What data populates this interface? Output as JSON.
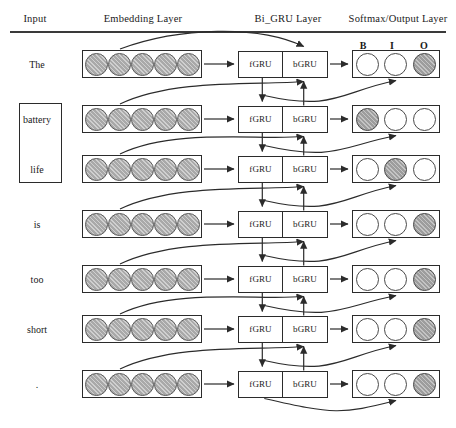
{
  "diagram": {
    "headers": [
      {
        "id": "input",
        "label": "Input",
        "x": 35,
        "y": 18
      },
      {
        "id": "embedding",
        "label": "Embedding Layer",
        "x": 143,
        "y": 18
      },
      {
        "id": "bigru",
        "label": "Bi_GRU Layer",
        "x": 288,
        "y": 18
      },
      {
        "id": "softmax",
        "label": "Softmax/Output Layer",
        "x": 398,
        "y": 18
      }
    ],
    "tag_labels": [
      {
        "tag": "B",
        "x": 363,
        "y": 40
      },
      {
        "tag": "I",
        "x": 392,
        "y": 40
      },
      {
        "tag": "O",
        "x": 424,
        "y": 40
      }
    ],
    "gru": {
      "forward_label": "fGRU",
      "backward_label": "bGRU"
    },
    "embedding_units_per_token": 5,
    "aspect_box": {
      "x": 19,
      "y": 103,
      "width": 41,
      "height": 78
    },
    "rows": [
      {
        "index": 0,
        "token": "The",
        "y": 64,
        "tags": [
          "B",
          "I",
          "O"
        ],
        "active": [
          false,
          false,
          true
        ]
      },
      {
        "index": 1,
        "token": "battery",
        "y": 119,
        "tags": [
          "B",
          "I",
          "O"
        ],
        "active": [
          true,
          false,
          false
        ]
      },
      {
        "index": 2,
        "token": "life",
        "y": 169,
        "tags": [
          "B",
          "I",
          "O"
        ],
        "active": [
          false,
          true,
          false
        ]
      },
      {
        "index": 3,
        "token": "is",
        "y": 224,
        "tags": [
          "B",
          "I",
          "O"
        ],
        "active": [
          false,
          false,
          true
        ]
      },
      {
        "index": 4,
        "token": "too",
        "y": 279,
        "tags": [
          "B",
          "I",
          "O"
        ],
        "active": [
          false,
          false,
          true
        ]
      },
      {
        "index": 5,
        "token": "short",
        "y": 329,
        "tags": [
          "B",
          "I",
          "O"
        ],
        "active": [
          false,
          false,
          true
        ]
      },
      {
        "index": 6,
        "token": ".",
        "y": 384,
        "tags": [
          "B",
          "I",
          "O"
        ],
        "active": [
          false,
          false,
          true
        ]
      }
    ],
    "colors": {
      "stroke": "#2b2b2b",
      "embedding_fill": "#a9a9a9",
      "output_active_fill": "#9d9d9d",
      "output_inactive_fill": "#ffffff",
      "rule": "#3a3a3a"
    },
    "geometry": {
      "word_center_x": 37,
      "embed_x": 82,
      "embed_width": 120,
      "embed_height": 28,
      "gru_x": 238,
      "gru_width": 90,
      "gru_height": 27,
      "soft_x": 352,
      "soft_width": 88,
      "soft_height": 28
    }
  }
}
